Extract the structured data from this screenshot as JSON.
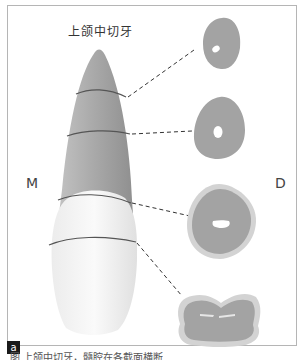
{
  "figure": {
    "title": "上颌中切牙",
    "mesial_label": "M",
    "distal_label": "D",
    "panel_label": "a",
    "caption_partial": "图    上颌中切牙，髓腔在各截面横断"
  },
  "sections": [
    {
      "level": 1,
      "name": "root-apical-third",
      "shape": "oval",
      "canal": "small-round"
    },
    {
      "level": 2,
      "name": "root-middle-third",
      "shape": "rounded-triangle",
      "canal": "round"
    },
    {
      "level": 3,
      "name": "cervical",
      "shape": "rounded-triangle-with-enamel-rim",
      "canal": "mesiodistal-slit"
    },
    {
      "level": 4,
      "name": "crown",
      "shape": "bilobed-with-enamel",
      "canal": "flattened-slit"
    }
  ],
  "colors": {
    "root": "#a9a9a9",
    "crown": "#f2f2f2",
    "section_fill": "#a3a3a3",
    "enamel_rim": "#d3d3d3",
    "cut_line": "#555555",
    "frame": "#b5b5b5"
  }
}
